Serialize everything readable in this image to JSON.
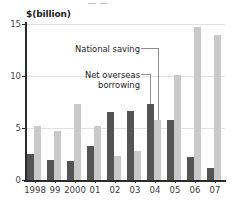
{
  "figure": {
    "title_sliver": "— —",
    "ylabel": "$(billion)"
  },
  "annotations": {
    "national_saving": "National saving",
    "net_overseas_borrowing": "Net overseas\nborrowing"
  },
  "chart_data": {
    "type": "bar",
    "title": "",
    "xlabel": "",
    "ylabel": "$(billion)",
    "ylim": [
      0,
      15
    ],
    "yticks": [
      0,
      5,
      10,
      15
    ],
    "ytick_labels": [
      "0",
      "5",
      "10",
      "15"
    ],
    "grid": true,
    "legend": "annotated-inline",
    "categories": [
      "1998",
      "99",
      "2000",
      "01",
      "02",
      "03",
      "04",
      "05",
      "06",
      "07"
    ],
    "series": [
      {
        "name": "Net overseas borrowing",
        "color": "#545454",
        "values": [
          2.5,
          1.9,
          1.8,
          3.3,
          6.5,
          6.6,
          7.3,
          5.8,
          2.2,
          1.2
        ]
      },
      {
        "name": "National saving",
        "color": "#c9c9c9",
        "values": [
          5.2,
          4.7,
          7.3,
          5.2,
          2.3,
          2.8,
          5.8,
          10.1,
          14.7,
          13.9
        ]
      }
    ]
  }
}
